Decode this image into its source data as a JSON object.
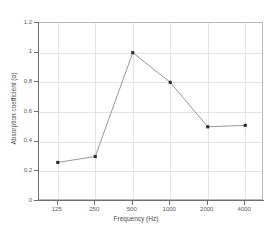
{
  "chart_data": {
    "type": "line",
    "title": "",
    "xlabel": "Frequency (Hz)",
    "ylabel": "Absorption coefficient (α)",
    "categories": [
      "125",
      "250",
      "500",
      "1000",
      "2000",
      "4000"
    ],
    "values": [
      0.26,
      0.3,
      1.0,
      0.8,
      0.5,
      0.51
    ],
    "series": [
      {
        "name": "Absorption coefficient",
        "values": [
          0.26,
          0.3,
          1.0,
          0.8,
          0.5,
          0.51
        ]
      }
    ],
    "ylim": [
      0,
      1.2
    ],
    "yticks": [
      "0",
      "0.2",
      "0.4",
      "0.6",
      "0.8",
      "1",
      "1.2"
    ],
    "ytick_values": [
      0,
      0.2,
      0.4,
      0.6,
      0.8,
      1.0,
      1.2
    ],
    "xticks": [
      "125",
      "250",
      "500",
      "1000",
      "2000",
      "4000"
    ],
    "grid": true,
    "legend": "none",
    "marker": "square",
    "marker_color": "#2b2b2b",
    "line_color": "#8c8c8c",
    "grid_color": "#e3e3e3",
    "axis_color": "#6e6e6e",
    "background": "#ffffff"
  }
}
